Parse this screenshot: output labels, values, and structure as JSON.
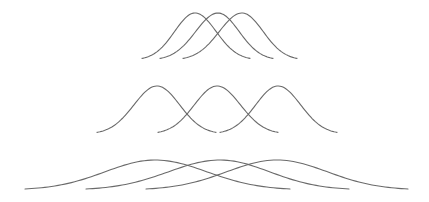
{
  "diagram": {
    "stroke_color": "#6a6a6a",
    "stroke_width": 1.1,
    "rows": [
      {
        "name": "narrow-spaced",
        "baseline_y": 60,
        "peak_y": 13,
        "curves": [
          {
            "start_x": 142,
            "peak_x": 195,
            "end_x": 250
          },
          {
            "start_x": 160,
            "peak_x": 218,
            "end_x": 273
          },
          {
            "start_x": 183,
            "peak_x": 242,
            "end_x": 297
          }
        ]
      },
      {
        "name": "medium-spaced",
        "baseline_y": 134,
        "peak_y": 86,
        "curves": [
          {
            "start_x": 97,
            "peak_x": 157,
            "end_x": 216
          },
          {
            "start_x": 158,
            "peak_x": 217,
            "end_x": 278
          },
          {
            "start_x": 220,
            "peak_x": 278,
            "end_x": 337
          }
        ]
      },
      {
        "name": "wide-flat",
        "baseline_y": 190,
        "peak_y": 160,
        "curves": [
          {
            "start_x": 25,
            "peak_x": 155,
            "end_x": 290
          },
          {
            "start_x": 86,
            "peak_x": 220,
            "end_x": 349
          },
          {
            "start_x": 146,
            "peak_x": 277,
            "end_x": 408
          }
        ]
      }
    ]
  }
}
